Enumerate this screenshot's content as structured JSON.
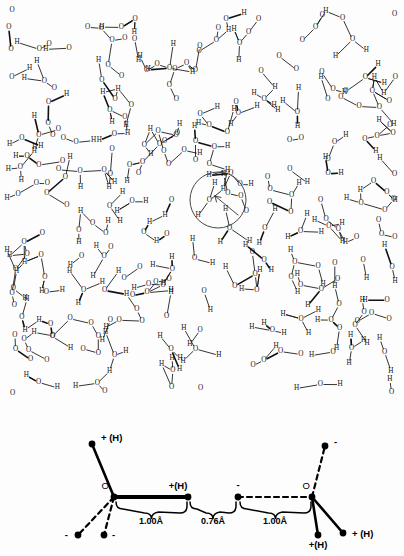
{
  "figure": {
    "name": "water-hydrogen-bond-figure",
    "background": "#fdfdfd",
    "ink_color": "#111111"
  },
  "network_panel": {
    "name": "water-network-diagram",
    "description": "Dense random network of hydrogen-bonded water molecules drawn as O and H atom letters joined by bond lines",
    "atom_labels": [
      "O",
      "H"
    ],
    "highlight": {
      "shape": "circle",
      "center_x": 218,
      "center_y": 200,
      "radius": 28,
      "arrow_from_x": 238,
      "arrow_from_y": 215,
      "arrow_to_x": 215,
      "arrow_to_y": 196
    }
  },
  "bond_panel": {
    "name": "hydrogen-bond-geometry-diagram",
    "atoms": {
      "left_oxygen": "O",
      "right_oxygen": "O"
    },
    "charge_labels": {
      "positive_h": "+ (H)",
      "positive_h_compact": "+(H)",
      "negative": "-"
    },
    "labels": [
      {
        "text": "+ (H)",
        "x": 101,
        "y": 441,
        "anchor": "start"
      },
      {
        "text": "O",
        "x": 109,
        "y": 489,
        "anchor": "end"
      },
      {
        "text": "+(H)",
        "x": 178,
        "y": 489,
        "anchor": "middle"
      },
      {
        "text": "-",
        "x": 238,
        "y": 488,
        "anchor": "middle"
      },
      {
        "text": "O",
        "x": 310,
        "y": 489,
        "anchor": "end"
      },
      {
        "text": "-",
        "x": 334,
        "y": 445,
        "anchor": "start"
      },
      {
        "text": "-",
        "x": 68,
        "y": 538,
        "anchor": "end"
      },
      {
        "text": "-",
        "x": 112,
        "y": 538,
        "anchor": "start"
      },
      {
        "text": "+(H)",
        "x": 318,
        "y": 548,
        "anchor": "middle"
      },
      {
        "text": "+ (H)",
        "x": 352,
        "y": 537,
        "anchor": "start"
      }
    ],
    "dimensions": [
      {
        "text": "1.00Å",
        "x": 151,
        "y": 521,
        "from_x": 116,
        "to_x": 187
      },
      {
        "text": "0.76Å",
        "x": 213,
        "y": 521,
        "from_x": 190,
        "to_x": 236
      },
      {
        "text": "1.00Å",
        "x": 275,
        "y": 521,
        "from_x": 240,
        "to_x": 311
      }
    ]
  }
}
